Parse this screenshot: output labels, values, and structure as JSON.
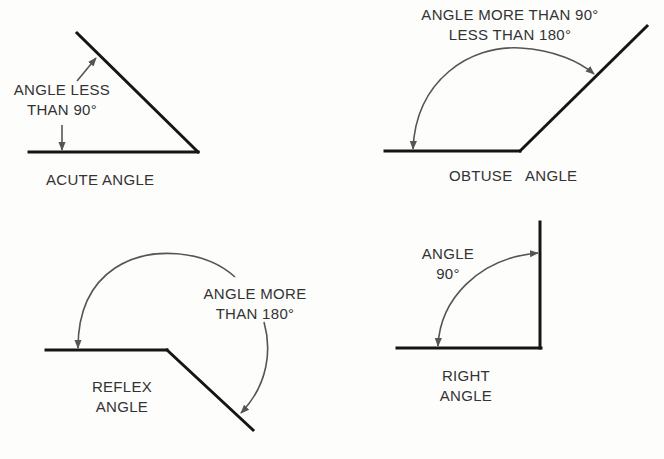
{
  "diagram": {
    "panels": [
      {
        "id": "acute",
        "title": "ACUTE ANGLE",
        "annotation_lines": [
          "ANGLE LESS",
          "THAN 90°"
        ]
      },
      {
        "id": "obtuse",
        "title": "OBTUSE   ANGLE",
        "annotation_lines": [
          "ANGLE MORE THAN 90°",
          "LESS THAN 180°"
        ]
      },
      {
        "id": "reflex",
        "title_lines": [
          "REFLEX",
          "ANGLE"
        ],
        "annotation_lines": [
          "ANGLE MORE",
          "THAN 180°"
        ]
      },
      {
        "id": "right",
        "title_lines": [
          "RIGHT",
          "ANGLE"
        ],
        "annotation_lines": [
          "ANGLE",
          "90°"
        ]
      }
    ],
    "colors": {
      "line": "#151515",
      "arrow": "#555555",
      "text": "#333333",
      "background": "#fdfdfc"
    }
  }
}
